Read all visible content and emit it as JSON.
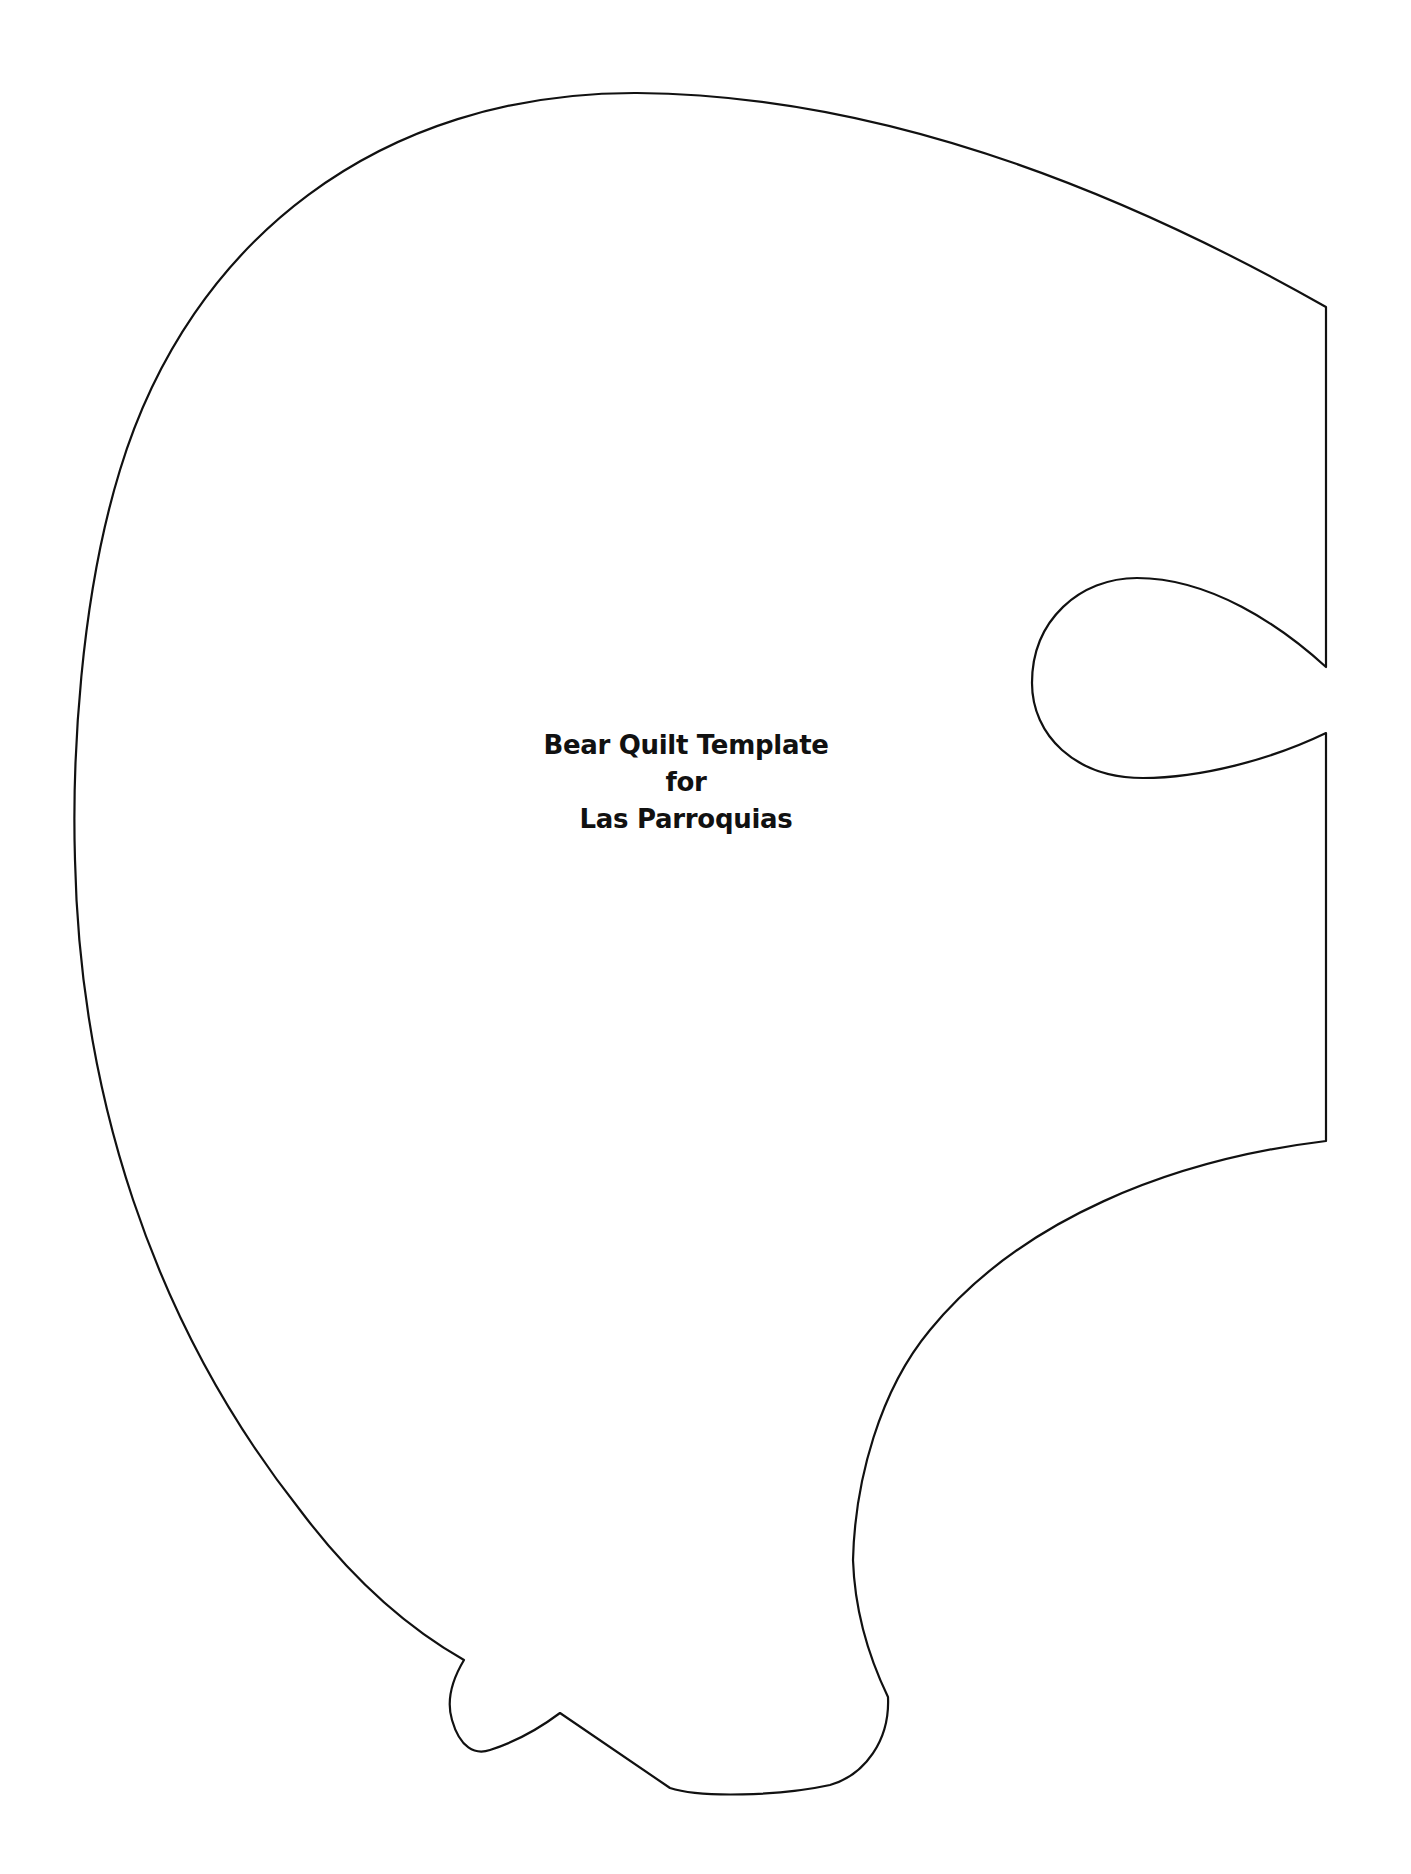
{
  "document": {
    "title_lines": [
      "Bear Quilt Template",
      "for",
      "Las Parroquias"
    ],
    "template_shape": "bear-head-outline",
    "colors": {
      "background": "#ffffff",
      "outline": "#111111",
      "text": "#111111"
    }
  }
}
